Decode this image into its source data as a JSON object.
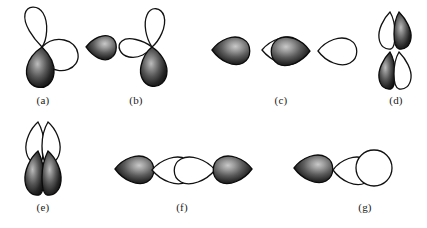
{
  "figure": {
    "width": 427,
    "height": 228,
    "background_color": "#ffffff",
    "outline_color": "#111111",
    "lobe_dark_fill": "#1b1b1b",
    "lobe_dark_highlight": "#b9b9b9",
    "lobe_light_fill": "#ffffff",
    "label_color": "#1a1a1a"
  },
  "panels": [
    {
      "id": "a",
      "label": "(a)",
      "label_x": 43,
      "label_y": 100,
      "description": "Three lobes meeting at one node: tall white lobe up-left, round white lobe right, dark teardrop lobe down",
      "lobe_count": 3,
      "dark_lobes": 1,
      "light_lobes": 2
    },
    {
      "id": "b",
      "label": "(b)",
      "label_x": 136,
      "label_y": 100,
      "description": "Separate dark lobe at left, plus three-lobe node: white lobe up, white lobe left, dark lobe down",
      "lobe_count": 4,
      "dark_lobes": 2,
      "light_lobes": 2
    },
    {
      "id": "c",
      "label": "(c)",
      "label_x": 281,
      "label_y": 100,
      "description": "Dark lobe pointing left, then overlapping white and dark horizontal lobes, then white lobe pointing left",
      "lobe_count": 4,
      "dark_lobes": 2,
      "light_lobes": 2
    },
    {
      "id": "d",
      "label": "(d)",
      "label_x": 396,
      "label_y": 100,
      "description": "Upper pair white-left dark-right, lower pair dark-left white-right, all vertical teardrops",
      "lobe_count": 4,
      "dark_lobes": 2,
      "light_lobes": 2
    },
    {
      "id": "e",
      "label": "(e)",
      "label_x": 43,
      "label_y": 207,
      "description": "Two white vertical lobes above two dark vertical lobes",
      "lobe_count": 4,
      "dark_lobes": 2,
      "light_lobes": 2
    },
    {
      "id": "f",
      "label": "(f)",
      "label_x": 182,
      "label_y": 207,
      "description": "Dark lobe pointing left, two overlapping white horizontal lobes in centre, dark lobe pointing right",
      "lobe_count": 4,
      "dark_lobes": 2,
      "light_lobes": 2
    },
    {
      "id": "g",
      "label": "(g)",
      "label_x": 365,
      "label_y": 207,
      "description": "Dark lobe pointing left, white lobe pointing left, white circle at right",
      "lobe_count": 3,
      "dark_lobes": 1,
      "light_lobes": 2
    }
  ]
}
